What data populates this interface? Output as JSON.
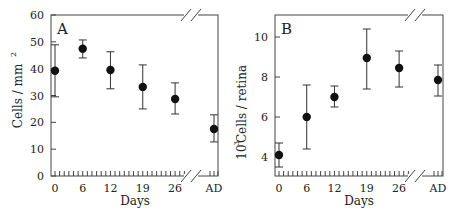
{
  "figure": {
    "panels": [
      {
        "letter": "A",
        "ylabel": "Cells / mm",
        "ylabel_sup": "2",
        "xlabel": "Days"
      },
      {
        "letter": "B",
        "ylabel": "Cells / retina",
        "ylabel_prefix": "10",
        "ylabel_sup": "3",
        "xlabel": "Days"
      }
    ]
  },
  "chart_data": [
    {
      "type": "scatter",
      "title": "A",
      "xlabel": "Days",
      "ylabel": "Cells / mm^2",
      "categories": [
        "0",
        "6",
        "12",
        "19",
        "26",
        "AD"
      ],
      "x": [
        0,
        6,
        12,
        19,
        26,
        "AD"
      ],
      "values": [
        39.2,
        47.4,
        39.5,
        33.2,
        28.7,
        17.5
      ],
      "error_low": [
        29.5,
        44.0,
        32.5,
        25.0,
        23.1,
        12.7
      ],
      "error_high": [
        48.9,
        50.7,
        46.3,
        41.4,
        34.7,
        22.8
      ],
      "yticks": [
        0,
        10,
        20,
        30,
        40,
        50,
        60
      ],
      "ylim": [
        0,
        60
      ],
      "axis_break": "between 26 and AD",
      "grid": false,
      "legend": null
    },
    {
      "type": "scatter",
      "title": "B",
      "xlabel": "Days",
      "ylabel": "10^3 Cells / retina",
      "categories": [
        "0",
        "6",
        "12",
        "19",
        "26",
        "AD"
      ],
      "x": [
        0,
        6,
        12,
        19,
        26,
        "AD"
      ],
      "values": [
        4.1,
        6.0,
        7.0,
        8.95,
        8.45,
        7.85
      ],
      "error_low": [
        3.5,
        4.4,
        6.5,
        7.4,
        7.5,
        7.05
      ],
      "error_high": [
        4.7,
        7.6,
        7.55,
        10.4,
        9.3,
        8.6
      ],
      "yticks": [
        4,
        6,
        8,
        10
      ],
      "ylim": [
        3.05,
        11.1
      ],
      "axis_break": "between 26 and AD",
      "grid": false,
      "legend": null
    }
  ]
}
